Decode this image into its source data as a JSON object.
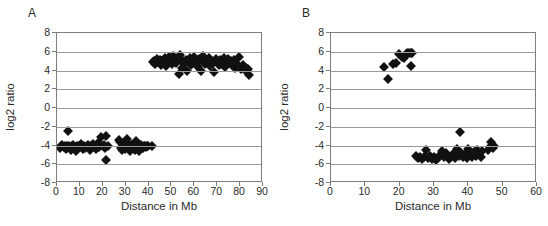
{
  "figure": {
    "panels": [
      {
        "letter": "A",
        "xlabel": "Distance in Mb",
        "ylabel": "log2 ratio",
        "xticks": [
          "0",
          "10",
          "20",
          "30",
          "40",
          "50",
          "60",
          "70",
          "80",
          "90"
        ],
        "yticks": [
          "8",
          "6",
          "4",
          "2",
          "0",
          "-2",
          "-4",
          "-6",
          "-8"
        ]
      },
      {
        "letter": "B",
        "xlabel": "Distance in Mb",
        "ylabel": "log2 ratio",
        "xticks": [
          "0",
          "10",
          "20",
          "30",
          "40",
          "50",
          "60"
        ],
        "yticks": [
          "8",
          "6",
          "4",
          "2",
          "0",
          "-2",
          "-4",
          "-6",
          "-8"
        ]
      }
    ]
  },
  "chart_data": [
    {
      "type": "scatter",
      "panel": "A",
      "title": "",
      "xlabel": "Distance in Mb",
      "ylabel": "log2 ratio",
      "xlim": [
        0,
        90
      ],
      "ylim": [
        -8,
        8
      ],
      "xticks": [
        0,
        10,
        20,
        30,
        40,
        50,
        60,
        70,
        80,
        90
      ],
      "yticks": [
        8,
        6,
        4,
        2,
        0,
        -2,
        -4,
        -6,
        -8
      ],
      "grid": "horizontal",
      "legend": "none",
      "marker": "diamond",
      "marker_color": "#111111",
      "series": [
        {
          "name": "log2 ratio vs distance",
          "points": [
            [
              1.4,
              -4.3
            ],
            [
              1.9,
              -4.1
            ],
            [
              2.4,
              -3.9
            ],
            [
              2.9,
              -4.2
            ],
            [
              3.4,
              -4.0
            ],
            [
              3.9,
              -4.4
            ],
            [
              4.4,
              -4.1
            ],
            [
              4.9,
              -2.5
            ],
            [
              5.2,
              -4.0
            ],
            [
              5.7,
              -4.3
            ],
            [
              6.2,
              -4.5
            ],
            [
              6.7,
              -4.1
            ],
            [
              7.2,
              -3.9
            ],
            [
              7.7,
              -4.2
            ],
            [
              8.2,
              -4.6
            ],
            [
              8.7,
              -4.0
            ],
            [
              9.2,
              -4.3
            ],
            [
              9.7,
              -4.1
            ],
            [
              10.3,
              -3.8
            ],
            [
              10.8,
              -4.2
            ],
            [
              11.3,
              -4.4
            ],
            [
              11.8,
              -4.0
            ],
            [
              12.3,
              -4.3
            ],
            [
              12.9,
              -4.1
            ],
            [
              13.4,
              -3.9
            ],
            [
              13.9,
              -4.2
            ],
            [
              14.4,
              -4.5
            ],
            [
              14.9,
              -4.0
            ],
            [
              15.4,
              -4.2
            ],
            [
              15.9,
              -3.8
            ],
            [
              16.4,
              -4.1
            ],
            [
              16.9,
              -4.4
            ],
            [
              17.4,
              -4.0
            ],
            [
              17.9,
              -3.7
            ],
            [
              18.4,
              -4.2
            ],
            [
              18.9,
              -3.9
            ],
            [
              19.4,
              -3.1
            ],
            [
              19.9,
              -4.1
            ],
            [
              20.4,
              -3.9
            ],
            [
              20.9,
              -4.3
            ],
            [
              21.2,
              -5.5
            ],
            [
              21.6,
              -3.0
            ],
            [
              22.1,
              -4.1
            ],
            [
              26.9,
              -3.4
            ],
            [
              27.4,
              -3.6
            ],
            [
              27.9,
              -4.3
            ],
            [
              28.4,
              -4.5
            ],
            [
              28.9,
              -3.9
            ],
            [
              29.4,
              -4.1
            ],
            [
              29.9,
              -4.4
            ],
            [
              30.4,
              -3.3
            ],
            [
              30.9,
              -3.7
            ],
            [
              31.4,
              -4.2
            ],
            [
              31.9,
              -4.6
            ],
            [
              32.4,
              -4.1
            ],
            [
              32.9,
              -3.9
            ],
            [
              33.4,
              -4.3
            ],
            [
              33.9,
              -4.5
            ],
            [
              34.4,
              -3.5
            ],
            [
              34.9,
              -4.0
            ],
            [
              35.4,
              -4.2
            ],
            [
              35.9,
              -4.6
            ],
            [
              36.4,
              -4.1
            ],
            [
              36.9,
              -3.9
            ],
            [
              37.4,
              -4.3
            ],
            [
              37.9,
              -4.1
            ],
            [
              38.4,
              -4.0
            ],
            [
              38.9,
              -4.2
            ],
            [
              39.4,
              -4.1
            ],
            [
              39.9,
              -4.0
            ],
            [
              41.5,
              -4.1
            ],
            [
              41.8,
              4.9
            ],
            [
              42.4,
              5.0
            ],
            [
              43.0,
              4.7
            ],
            [
              43.6,
              5.2
            ],
            [
              44.2,
              4.9
            ],
            [
              44.8,
              5.1
            ],
            [
              45.4,
              4.6
            ],
            [
              46.0,
              5.0
            ],
            [
              46.6,
              4.8
            ],
            [
              47.2,
              5.3
            ],
            [
              47.8,
              4.5
            ],
            [
              48.4,
              4.9
            ],
            [
              49.0,
              5.4
            ],
            [
              49.6,
              5.1
            ],
            [
              50.2,
              4.7
            ],
            [
              50.8,
              5.5
            ],
            [
              51.4,
              5.0
            ],
            [
              52.0,
              4.8
            ],
            [
              52.6,
              5.2
            ],
            [
              53.2,
              3.6
            ],
            [
              53.8,
              5.7
            ],
            [
              54.4,
              4.3
            ],
            [
              55.0,
              5.0
            ],
            [
              55.6,
              4.7
            ],
            [
              56.2,
              5.1
            ],
            [
              56.8,
              4.0
            ],
            [
              57.4,
              4.9
            ],
            [
              58.0,
              5.3
            ],
            [
              58.6,
              4.6
            ],
            [
              59.2,
              5.0
            ],
            [
              59.8,
              5.4
            ],
            [
              60.4,
              4.8
            ],
            [
              61.0,
              5.1
            ],
            [
              61.6,
              4.4
            ],
            [
              62.2,
              5.2
            ],
            [
              62.8,
              4.0
            ],
            [
              63.4,
              5.0
            ],
            [
              64.0,
              5.5
            ],
            [
              64.6,
              4.7
            ],
            [
              65.2,
              5.1
            ],
            [
              65.8,
              4.9
            ],
            [
              66.4,
              5.3
            ],
            [
              67.0,
              4.5
            ],
            [
              67.6,
              5.0
            ],
            [
              68.2,
              4.8
            ],
            [
              68.8,
              3.8
            ],
            [
              69.4,
              5.2
            ],
            [
              70.0,
              4.9
            ],
            [
              70.6,
              4.6
            ],
            [
              71.2,
              5.1
            ],
            [
              71.8,
              4.7
            ],
            [
              72.4,
              5.0
            ],
            [
              73.0,
              5.3
            ],
            [
              73.6,
              4.4
            ],
            [
              74.2,
              4.9
            ],
            [
              74.8,
              5.2
            ],
            [
              75.4,
              4.8
            ],
            [
              76.0,
              5.0
            ],
            [
              76.6,
              4.6
            ],
            [
              77.2,
              5.1
            ],
            [
              77.8,
              4.3
            ],
            [
              78.4,
              4.8
            ],
            [
              79.0,
              4.5
            ],
            [
              79.6,
              5.4
            ],
            [
              80.2,
              4.2
            ],
            [
              80.8,
              4.4
            ],
            [
              81.4,
              4.6
            ],
            [
              82.0,
              4.1
            ],
            [
              82.6,
              4.3
            ],
            [
              83.2,
              3.9
            ],
            [
              83.6,
              4.2
            ],
            [
              84.0,
              3.5
            ]
          ]
        }
      ]
    },
    {
      "type": "scatter",
      "panel": "B",
      "title": "",
      "xlabel": "Distance in Mb",
      "ylabel": "log2 ratio",
      "xlim": [
        0,
        60
      ],
      "ylim": [
        -8,
        8
      ],
      "xticks": [
        0,
        10,
        20,
        30,
        40,
        50,
        60
      ],
      "yticks": [
        8,
        6,
        4,
        2,
        0,
        -2,
        -4,
        -6,
        -8
      ],
      "grid": "horizontal",
      "legend": "none",
      "marker": "diamond",
      "marker_color": "#111111",
      "series": [
        {
          "name": "log2 ratio vs distance",
          "points": [
            [
              15.5,
              4.4
            ],
            [
              16.7,
              3.1
            ],
            [
              18.2,
              4.7
            ],
            [
              19.0,
              4.8
            ],
            [
              19.8,
              5.8
            ],
            [
              20.6,
              5.4
            ],
            [
              21.3,
              5.3
            ],
            [
              22.1,
              5.9
            ],
            [
              22.7,
              5.9
            ],
            [
              23.2,
              5.9
            ],
            [
              23.6,
              5.9
            ],
            [
              23.4,
              4.5
            ],
            [
              24.9,
              -5.1
            ],
            [
              25.4,
              -5.3
            ],
            [
              26.0,
              -5.2
            ],
            [
              26.6,
              -5.4
            ],
            [
              27.2,
              -5.2
            ],
            [
              27.8,
              -4.5
            ],
            [
              28.3,
              -5.3
            ],
            [
              28.9,
              -5.1
            ],
            [
              29.5,
              -5.4
            ],
            [
              30.1,
              -5.2
            ],
            [
              30.6,
              -5.5
            ],
            [
              31.2,
              -5.3
            ],
            [
              31.8,
              -5.0
            ],
            [
              32.3,
              -4.6
            ],
            [
              32.9,
              -5.2
            ],
            [
              33.4,
              -4.8
            ],
            [
              34.0,
              -5.1
            ],
            [
              34.5,
              -5.4
            ],
            [
              35.0,
              -5.2
            ],
            [
              35.6,
              -4.9
            ],
            [
              36.1,
              -5.3
            ],
            [
              36.7,
              -4.4
            ],
            [
              37.2,
              -5.1
            ],
            [
              37.6,
              -2.6
            ],
            [
              37.9,
              -4.8
            ],
            [
              38.4,
              -5.2
            ],
            [
              39.0,
              -4.9
            ],
            [
              39.5,
              -5.3
            ],
            [
              40.0,
              -4.4
            ],
            [
              40.5,
              -5.0
            ],
            [
              41.0,
              -5.2
            ],
            [
              41.6,
              -4.7
            ],
            [
              42.1,
              -5.1
            ],
            [
              42.6,
              -4.5
            ],
            [
              43.1,
              -4.9
            ],
            [
              43.6,
              -5.2
            ],
            [
              44.1,
              -4.6
            ],
            [
              45.8,
              -4.5
            ],
            [
              46.3,
              -4.2
            ],
            [
              46.7,
              -3.6
            ],
            [
              47.1,
              -4.3
            ],
            [
              47.5,
              -4.0
            ]
          ]
        }
      ]
    }
  ]
}
